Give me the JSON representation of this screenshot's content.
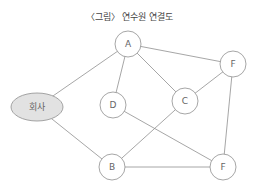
{
  "title": "〈그림〉 연수원 연결도",
  "diagram": {
    "nodes": [
      {
        "id": "A",
        "label": "A",
        "shape": "circle",
        "cx": 128,
        "cy": 44,
        "r": 13
      },
      {
        "id": "F_top",
        "label": "F",
        "shape": "circle",
        "cx": 233,
        "cy": 64,
        "r": 13
      },
      {
        "id": "company",
        "label": "회사",
        "shape": "ellipse",
        "cx": 37,
        "cy": 107,
        "rx": 26,
        "ry": 14,
        "fill": "#e2e2e2"
      },
      {
        "id": "D",
        "label": "D",
        "shape": "circle",
        "cx": 113,
        "cy": 105,
        "r": 13
      },
      {
        "id": "C",
        "label": "C",
        "shape": "circle",
        "cx": 185,
        "cy": 101,
        "r": 13
      },
      {
        "id": "B",
        "label": "B",
        "shape": "circle",
        "cx": 112,
        "cy": 167,
        "r": 13
      },
      {
        "id": "F_bottom",
        "label": "F",
        "shape": "circle",
        "cx": 223,
        "cy": 167,
        "r": 13
      }
    ],
    "edges": [
      {
        "from": "A",
        "to": "company"
      },
      {
        "from": "A",
        "to": "D"
      },
      {
        "from": "A",
        "to": "C"
      },
      {
        "from": "A",
        "to": "F_top"
      },
      {
        "from": "F_top",
        "to": "C"
      },
      {
        "from": "F_top",
        "to": "F_bottom"
      },
      {
        "from": "company",
        "to": "B"
      },
      {
        "from": "D",
        "to": "F_bottom"
      },
      {
        "from": "C",
        "to": "B"
      },
      {
        "from": "B",
        "to": "F_bottom"
      }
    ],
    "colors": {
      "stroke": "#8f8f8f",
      "text": "#666666",
      "company_fill": "#e2e2e2"
    }
  }
}
